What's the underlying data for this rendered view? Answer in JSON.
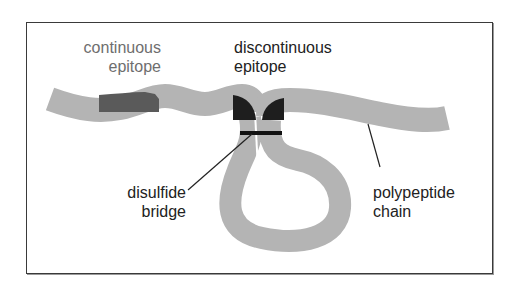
{
  "diagram": {
    "labels": {
      "continuous_epitope": [
        "continuous",
        "epitope"
      ],
      "discontinuous_epitope": [
        "discontinuous",
        "epitope"
      ],
      "disulfide_bridge": [
        "disulfide",
        "bridge"
      ],
      "polypeptide_chain": [
        "polypeptide",
        "chain"
      ]
    },
    "colors": {
      "chain": "#b4b4b4",
      "continuous_epitope": "#5a5a5a",
      "discontinuous_epitope": "#1e1e1e",
      "bridge": "#111111",
      "frame": "#3a3a3a",
      "continuous_label": "#6e6e6e",
      "other_labels": "#222222"
    }
  }
}
